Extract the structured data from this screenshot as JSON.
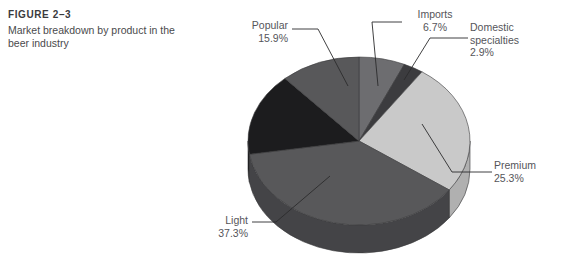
{
  "figure": {
    "number": "FIGURE 2–3",
    "title": "Market breakdown by product in the beer industry"
  },
  "source_note": {
    "text": "",
    "legible": false
  },
  "chart_data": {
    "type": "pie",
    "title": "Market breakdown by product in the beer industry",
    "style": "3d-pie",
    "legend": "none",
    "labels_position": "outside-with-leader-lines",
    "units": "percent",
    "categories": [
      "Imports",
      "Domestic specialties",
      "Premium",
      "Light",
      "Popular"
    ],
    "values": [
      6.7,
      2.9,
      25.3,
      37.3,
      15.9
    ],
    "slices": [
      {
        "name": "Imports",
        "value": 6.7,
        "label": "Imports",
        "percent_label": "6.7%",
        "color": "#6d6d70",
        "side_color": "#55555a",
        "start_angle": 0,
        "end_angle": 24.12
      },
      {
        "name": "Domestic specialties",
        "value": 2.9,
        "label": "Domestic specialties",
        "label_line1": "Domestic",
        "label_line2": "specialties",
        "percent_label": "2.9%",
        "color": "#3c3c3f",
        "side_color": "#2e2e31",
        "start_angle": 24.12,
        "end_angle": 34.56
      },
      {
        "name": "Premium",
        "value": 25.3,
        "label": "Premium",
        "percent_label": "25.3%",
        "color": "#c9c9c9",
        "side_color": "#b0b0b0",
        "start_angle": 34.56,
        "end_angle": 125.64
      },
      {
        "name": "Light",
        "value": 37.3,
        "label": "Light",
        "percent_label": "37.3%",
        "color": "#58585a",
        "side_color": "#444447",
        "start_angle": 125.64,
        "end_angle": 260.92
      },
      {
        "name": "Popular",
        "value": 15.9,
        "label": "Popular",
        "percent_label": "15.9%",
        "color": "#1c1c1e",
        "side_color": "#141416",
        "start_angle": 260.92,
        "end_angle": 318.16
      },
      {
        "name": "Popular-wrap",
        "value": 11.84,
        "label": "",
        "percent_label": "",
        "color": "#58585a",
        "side_color": "#444447",
        "start_angle": 318.16,
        "end_angle": 360
      }
    ],
    "total": 88.1,
    "geometry": {
      "center_x": 359,
      "center_y": 141,
      "radius_x": 111,
      "radius_y": 84,
      "depth": 28,
      "start_at_top": true
    }
  }
}
